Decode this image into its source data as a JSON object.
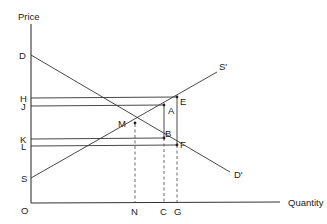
{
  "diagram": {
    "type": "supply-demand",
    "axes": {
      "y_label": "Price",
      "x_label": "Quantity",
      "origin_label": "O"
    },
    "curves": [
      {
        "name": "demand",
        "start_label": "D",
        "end_label": "D'"
      },
      {
        "name": "supply",
        "start_label": "S",
        "end_label": "S'"
      }
    ],
    "price_labels": [
      "H",
      "J",
      "K",
      "L"
    ],
    "quantity_labels": [
      "N",
      "C",
      "G"
    ],
    "points": [
      "M",
      "A",
      "B",
      "E",
      "F"
    ]
  },
  "labels": {
    "price": "Price",
    "quantity": "Quantity",
    "O": "O",
    "D": "D",
    "Dp": "D'",
    "S": "S",
    "Sp": "S'",
    "H": "H",
    "J": "J",
    "K": "K",
    "L": "L",
    "N": "N",
    "C": "C",
    "G": "G",
    "M": "M",
    "A": "A",
    "B": "B",
    "E": "E",
    "F": "F"
  }
}
